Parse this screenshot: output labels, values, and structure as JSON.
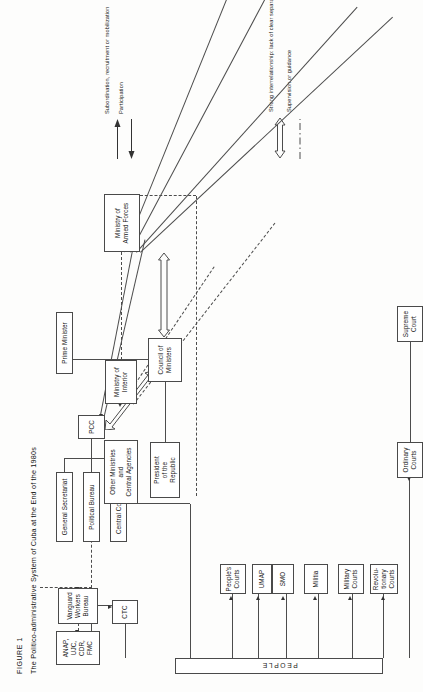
{
  "figure": {
    "label": "FIGURE 1",
    "caption": "The Politico-administrative System of Cuba at the End of the 1980s"
  },
  "nodes": {
    "prime_minister": "Prime Minister",
    "general_secretariat": "General Secretariat",
    "political_bureau": "Political Bureau",
    "central_committee": "Central Committee",
    "president_republic": "President\nof the\nRepublic",
    "president_line1": "President",
    "president_line2": "of the",
    "president_line3": "Republic",
    "pcc": "PCC",
    "council_ministers_l1": "Council of",
    "council_ministers_l2": "Ministers",
    "other_ministries_l1": "Other Ministries",
    "other_ministries_l2": "and",
    "other_ministries_l3": "Central Agencies",
    "ministry_interior_l1": "Ministry of",
    "ministry_interior_l2": "Interior",
    "ministry_armed_forces_l1": "Ministry of",
    "ministry_armed_forces_l2": "Armed Forces",
    "vanguard_l1": "Vanguard",
    "vanguard_l2": "Workers",
    "vanguard_l3": "Bureau",
    "ctc": "CTC",
    "mass_orgs_l1": "ANAP,",
    "mass_orgs_l2": "UJC,",
    "mass_orgs_l3": "CDR,",
    "mass_orgs_l4": "FMC",
    "peoples_courts_l1": "People's",
    "peoples_courts_l2": "Courts",
    "umap": "UMAP",
    "smo": "SMO",
    "militia": "Militia",
    "military_courts_l1": "Military",
    "military_courts_l2": "Courts",
    "revolutionary_courts_l1": "Revolu-",
    "revolutionary_courts_l2": "tionary",
    "revolutionary_courts_l3": "Courts",
    "supreme_court_l1": "Supreme",
    "supreme_court_l2": "Court",
    "ordinary_courts_l1": "Ordinary",
    "ordinary_courts_l2": "Courts",
    "people": "PEOPLE"
  },
  "legend": {
    "subordination": "Subordination, recruitment or mobilization",
    "participation": "Participation",
    "strong_interrelationship": "Strong interrelationship: lack of clear separation of functions",
    "supervision": "Supervision or guidance"
  },
  "colors": {
    "stroke": "#4c4c4c",
    "arrow": "#333333",
    "background": "#fdfdfc",
    "box_fill": "#ffffff"
  }
}
